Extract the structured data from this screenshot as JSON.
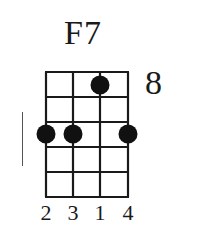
{
  "chord": {
    "name": "F7",
    "start_fret_label": "8",
    "strings": 4,
    "frets": 5,
    "dots": [
      {
        "string": 3,
        "fret": 1
      },
      {
        "string": 1,
        "fret": 3
      },
      {
        "string": 2,
        "fret": 3
      },
      {
        "string": 4,
        "fret": 3
      }
    ],
    "fingering": [
      "2",
      "3",
      "1",
      "4"
    ]
  },
  "colors": {
    "ink": "#1a1a1a",
    "background": "#ffffff"
  }
}
